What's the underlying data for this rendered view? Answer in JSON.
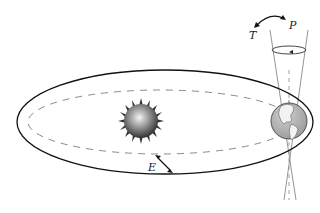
{
  "diagram": {
    "labels": {
      "tilt": "T",
      "precession": "P",
      "eccentricity": "E"
    },
    "elements": {
      "orbit": "elliptical orbit (solid)",
      "circular_orbit": "near-circular orbit (dashed)",
      "sun": "Sun",
      "earth": "Earth",
      "precession_cone": "precession cone of Earth's rotational axis"
    },
    "colors": {
      "orbit_stroke": "#111111",
      "dashed_orbit": "#888888",
      "cone_stroke": "#888888",
      "sun_light": "#f2f2f2",
      "sun_dark": "#3a3a3a",
      "earth_ocean": "#b8b8b8",
      "earth_land": "#f4f4f4"
    }
  }
}
